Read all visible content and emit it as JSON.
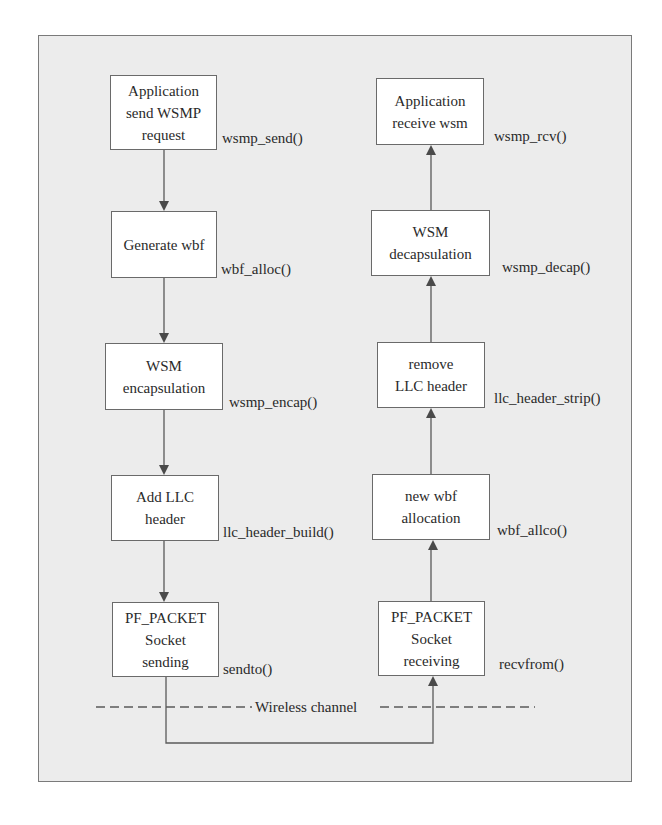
{
  "diagram": {
    "sender": {
      "steps": [
        {
          "lines": [
            "Application",
            "send WSMP",
            "request"
          ],
          "function": "wsmp_send()"
        },
        {
          "lines": [
            "Generate wbf"
          ],
          "function": "wbf_alloc()"
        },
        {
          "lines": [
            "WSM",
            "encapsulation"
          ],
          "function": "wsmp_encap()"
        },
        {
          "lines": [
            "Add LLC",
            "header"
          ],
          "function": "llc_header_build()"
        },
        {
          "lines": [
            "PF_PACKET",
            "Socket",
            "sending"
          ],
          "function": "sendto()"
        }
      ]
    },
    "receiver": {
      "steps": [
        {
          "lines": [
            "Application",
            "receive wsm"
          ],
          "function": "wsmp_rcv()"
        },
        {
          "lines": [
            "WSM",
            "decapsulation"
          ],
          "function": "wsmp_decap()"
        },
        {
          "lines": [
            "remove",
            "LLC header"
          ],
          "function": "llc_header_strip()"
        },
        {
          "lines": [
            "new wbf",
            "allocation"
          ],
          "function": "wbf_allco()"
        },
        {
          "lines": [
            "PF_PACKET",
            "Socket",
            "receiving"
          ],
          "function": "recvfrom()"
        }
      ]
    },
    "channel_label": "Wireless channel",
    "colors": {
      "frame_bg": "#ececec",
      "box_bg": "#ffffff",
      "line": "#5a5a5a"
    }
  }
}
